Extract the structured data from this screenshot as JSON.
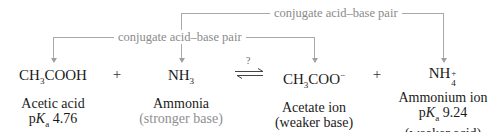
{
  "brackets": [
    {
      "label": "conjugate acid–base pair",
      "connects": [
        "NH3",
        "NH4+"
      ]
    },
    {
      "label": "conjugate acid–base pair",
      "connects": [
        "CH3COOH",
        "CH3COO−"
      ]
    }
  ],
  "equilibrium": {
    "question_mark": "?"
  },
  "species": [
    {
      "formula_main": "CH",
      "formula_sub": "3",
      "formula_rest": "COOH",
      "name": "Acetic acid",
      "pka_prefix": "p",
      "pka_k": "K",
      "pka_sub": "a",
      "pka_value": " 4.76",
      "role": "(stronger acid)"
    },
    {
      "formula_main": "NH",
      "formula_sub": "3",
      "name": "Ammonia",
      "role": "(stronger base)"
    },
    {
      "formula_main": "CH",
      "formula_sub": "3",
      "formula_rest": "COO",
      "formula_sup": "−",
      "name": "Acetate ion",
      "role": "(weaker base)"
    },
    {
      "formula_main": "NH",
      "formula_sub": "4",
      "formula_sup": "+",
      "name": "Ammonium ion",
      "pka_prefix": "p",
      "pka_k": "K",
      "pka_sub": "a",
      "pka_value": " 9.24",
      "role": "(weaker acid)"
    }
  ],
  "operators": [
    "+",
    "+"
  ]
}
